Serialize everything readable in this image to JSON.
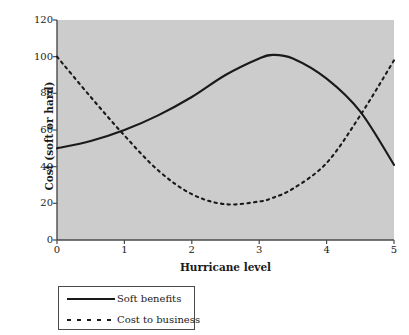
{
  "chart_data": {
    "type": "line",
    "title": "",
    "xlabel": "Hurricane level",
    "ylabel": "Cost (soft or hard)",
    "xlim": [
      0,
      5
    ],
    "ylim": [
      0,
      120
    ],
    "xticks": [
      "0",
      "1",
      "2",
      "3",
      "4",
      "5"
    ],
    "yticks": [
      "0",
      "20",
      "40",
      "60",
      "80",
      "100",
      "120"
    ],
    "grid": false,
    "legend_position": "below-left",
    "plot_background_color": "#cccccc",
    "line_color": "#1a1a1a",
    "x": [
      0,
      0.5,
      1,
      1.5,
      2,
      2.5,
      3,
      3.2,
      3.5,
      4,
      4.5,
      5
    ],
    "series": [
      {
        "name": "Soft benefits",
        "style": "solid",
        "values": [
          50,
          54,
          60,
          68,
          78,
          90,
          99,
          101,
          99,
          88,
          70,
          41
        ]
      },
      {
        "name": "Cost to business",
        "style": "dashed",
        "values": [
          100,
          78,
          57,
          38,
          25,
          19.5,
          21,
          23,
          28,
          42,
          68,
          98
        ]
      }
    ]
  },
  "legend": {
    "entries": [
      {
        "label": "Soft benefits",
        "style": "solid"
      },
      {
        "label": "Cost to business",
        "style": "dashed"
      }
    ]
  }
}
